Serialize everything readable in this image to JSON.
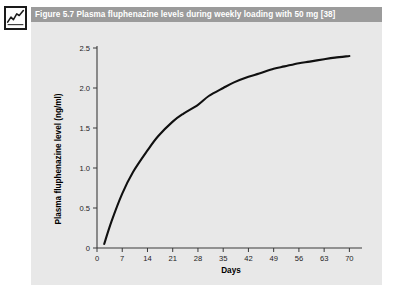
{
  "figure": {
    "icon_name": "line-chart-icon",
    "caption": "Figure 5.7  Plasma fluphenazine levels during weekly loading with 50 mg [38]",
    "panel_background": "#e8e8e8",
    "caption_bar_color": "#9b9b9b",
    "caption_text_color": "#ffffff"
  },
  "chart_data": {
    "type": "line",
    "title": "",
    "xlabel": "Days",
    "ylabel": "Plasma fluphenazine level (ng/ml)",
    "xlim": [
      0,
      73.5
    ],
    "ylim": [
      0,
      2.5
    ],
    "xticks": [
      0,
      7,
      14,
      21,
      28,
      35,
      42,
      49,
      56,
      63,
      70
    ],
    "xtick_labels": [
      "0",
      "7",
      "14",
      "21",
      "28",
      "35",
      "42",
      "49",
      "56",
      "63",
      "70"
    ],
    "yticks": [
      0,
      0.5,
      1.0,
      1.5,
      2.0,
      2.5
    ],
    "ytick_labels": [
      "0",
      "0.5",
      "1.0",
      "1.5",
      "2.0",
      "2.5"
    ],
    "grid": false,
    "legend": false,
    "line_color": "#101010",
    "series": [
      {
        "name": "Plasma fluphenazine level",
        "x": [
          2,
          4,
          7,
          10,
          14,
          17,
          21,
          24,
          28,
          31,
          35,
          38,
          42,
          45,
          49,
          52,
          56,
          59,
          63,
          66,
          70
        ],
        "y": [
          0.05,
          0.33,
          0.68,
          0.95,
          1.22,
          1.4,
          1.58,
          1.68,
          1.79,
          1.9,
          2.0,
          2.07,
          2.14,
          2.18,
          2.24,
          2.27,
          2.31,
          2.33,
          2.36,
          2.38,
          2.4
        ]
      }
    ]
  }
}
